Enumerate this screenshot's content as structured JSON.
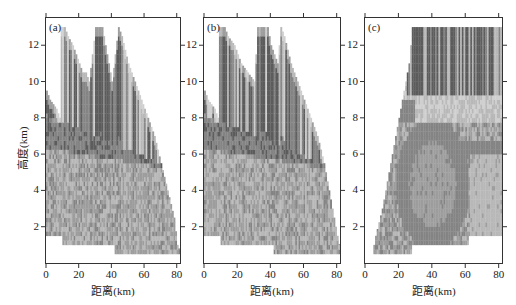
{
  "chart_data": [
    {
      "type": "heatmap",
      "panel_label": "(a)",
      "title": "",
      "xlabel": "距离(km)",
      "ylabel": "高度(km)",
      "xlim": [
        0,
        82
      ],
      "ylim": [
        0,
        13.5
      ],
      "xticks": [
        "0",
        "20",
        "40",
        "60",
        "80"
      ],
      "yticks": [
        "2",
        "4",
        "6",
        "8",
        "10",
        "12"
      ],
      "grid": false,
      "colormap": "grayscale",
      "echo_top_profile_km": [
        [
          0,
          9.5
        ],
        [
          2,
          9
        ],
        [
          6,
          8.5
        ],
        [
          8,
          8
        ],
        [
          9,
          13
        ],
        [
          11,
          13
        ],
        [
          13,
          12.5
        ],
        [
          16,
          12
        ],
        [
          18,
          11.5
        ],
        [
          22,
          10.5
        ],
        [
          24,
          10.5
        ],
        [
          26,
          10
        ],
        [
          30,
          13
        ],
        [
          34,
          13
        ],
        [
          36,
          12
        ],
        [
          38,
          11
        ],
        [
          40,
          10
        ],
        [
          44,
          13
        ],
        [
          46,
          12.5
        ],
        [
          50,
          11
        ],
        [
          54,
          10
        ],
        [
          58,
          9
        ],
        [
          62,
          8
        ],
        [
          66,
          7
        ],
        [
          70,
          5.5
        ],
        [
          74,
          4
        ],
        [
          78,
          2.5
        ],
        [
          80,
          1
        ],
        [
          82,
          0.6
        ]
      ],
      "echo_base_km": [
        [
          0,
          1.5
        ],
        [
          10,
          1.5
        ],
        [
          10,
          1
        ],
        [
          42,
          1
        ],
        [
          42,
          0.5
        ],
        [
          82,
          0.5
        ]
      ],
      "features": "Mid-level dark band near 6-8 km descending eastward; mottled gray texture below"
    },
    {
      "type": "heatmap",
      "panel_label": "(b)",
      "title": "",
      "xlabel": "距离(km)",
      "ylabel": "",
      "xlim": [
        0,
        82
      ],
      "ylim": [
        0,
        13.5
      ],
      "xticks": [
        "0",
        "20",
        "40",
        "60",
        "80"
      ],
      "yticks": [
        "2",
        "4",
        "6",
        "8",
        "10",
        "12"
      ],
      "grid": false,
      "colormap": "grayscale",
      "echo_top_profile_km": [
        [
          0,
          9.5
        ],
        [
          2,
          9
        ],
        [
          6,
          8.5
        ],
        [
          8,
          8
        ],
        [
          9,
          13
        ],
        [
          12,
          13
        ],
        [
          14,
          12.5
        ],
        [
          18,
          12
        ],
        [
          22,
          11
        ],
        [
          26,
          10.5
        ],
        [
          30,
          10
        ],
        [
          32,
          13
        ],
        [
          38,
          13
        ],
        [
          40,
          12
        ],
        [
          44,
          11
        ],
        [
          46,
          13
        ],
        [
          48,
          12.5
        ],
        [
          52,
          11
        ],
        [
          56,
          10
        ],
        [
          60,
          9
        ],
        [
          64,
          8
        ],
        [
          68,
          7
        ],
        [
          72,
          5.5
        ],
        [
          76,
          3.5
        ],
        [
          80,
          1.5
        ],
        [
          82,
          0.6
        ]
      ],
      "echo_base_km": [
        [
          0,
          1.5
        ],
        [
          10,
          1.5
        ],
        [
          10,
          1
        ],
        [
          42,
          1
        ],
        [
          42,
          0.5
        ],
        [
          82,
          0.5
        ]
      ],
      "features": "Similar structure to (a); dark band near 6-8 km"
    },
    {
      "type": "heatmap",
      "panel_label": "(c)",
      "title": "",
      "xlabel": "距离(km)",
      "ylabel": "",
      "xlim": [
        0,
        82
      ],
      "ylim": [
        0,
        13.5
      ],
      "xticks": [
        "0",
        "20",
        "40",
        "60",
        "80"
      ],
      "yticks": [
        "2",
        "4",
        "6",
        "8",
        "10",
        "12"
      ],
      "grid": false,
      "colormap": "grayscale",
      "echo_left_edge_km": [
        [
          4,
          0.5
        ],
        [
          6,
          1.5
        ],
        [
          10,
          3
        ],
        [
          14,
          5
        ],
        [
          18,
          7
        ],
        [
          22,
          9
        ],
        [
          26,
          11
        ],
        [
          28,
          13
        ]
      ],
      "echo_top_km": 13,
      "echo_base_km": [
        [
          4,
          0.5
        ],
        [
          28,
          0.5
        ],
        [
          28,
          1
        ],
        [
          62,
          1
        ],
        [
          62,
          1.5
        ],
        [
          82,
          1.5
        ]
      ],
      "features": "Dark vertical columns above 9 km from x≈25-82; ring-shaped mid-gray structure centered near x=40, 2-6 km"
    }
  ],
  "colors": {
    "c1": "#cfcfcf",
    "c2": "#b8b8b8",
    "c3": "#9d9d9d",
    "c4": "#848484",
    "c5": "#5c5c5c",
    "axis": "#333333"
  }
}
